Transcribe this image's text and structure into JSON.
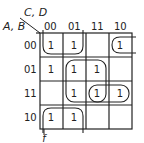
{
  "diagram": {
    "type": "karnaugh-map",
    "row_var_label": "A, B",
    "col_var_label": "C, D",
    "col_labels": [
      "00",
      "01",
      "11",
      "10"
    ],
    "row_labels": [
      "00",
      "01",
      "11",
      "10"
    ],
    "cells": [
      [
        "1",
        "1",
        "",
        "1"
      ],
      [
        "1",
        "1",
        "1",
        ""
      ],
      [
        "",
        "1",
        "1",
        "1"
      ],
      [
        "1",
        "1",
        "",
        ""
      ]
    ],
    "groupings": [
      {
        "name": "wrap-group-col00-01-rows10-00",
        "desc": "A'... columns 00,01 rows 10 and 00 (wraps top/bottom)"
      },
      {
        "name": "group-row00-col10-wrap",
        "desc": "row 00 col 10 wrapping to col 00"
      },
      {
        "name": "group-col01-11-rows01-11",
        "desc": "2x2 block columns 01,11 rows 01,11"
      },
      {
        "name": "group-row11-col11-10",
        "desc": "row 11 columns 11,10"
      }
    ],
    "annotation": "f",
    "line_color": "#222222"
  }
}
